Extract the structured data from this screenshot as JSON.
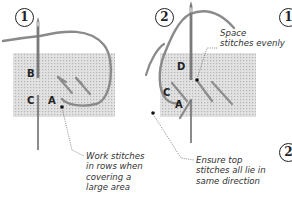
{
  "figure": {
    "type": "stitching-instruction-diagram",
    "colors": {
      "canvas": "#dcdcdc",
      "canvas_grid": "#b9b9b9",
      "thread": "#8a8a8a",
      "needle": "#6e6e6e",
      "text": "#333333"
    }
  },
  "panels": [
    {
      "step": "1",
      "points": {
        "b": "B",
        "c": "C",
        "a": "A"
      },
      "annotation": "Work stitches\nin rows when\ncovering a\nlarge area"
    },
    {
      "step": "2",
      "points": {
        "d": "D",
        "c": "C",
        "a": "A"
      },
      "annotation_top": "Space\nstitches evenly",
      "annotation_bottom": "Ensure top\nstitches all lie in\nsame direction"
    }
  ],
  "edge_markers": [
    {
      "step": "1"
    },
    {
      "step": "2"
    }
  ]
}
